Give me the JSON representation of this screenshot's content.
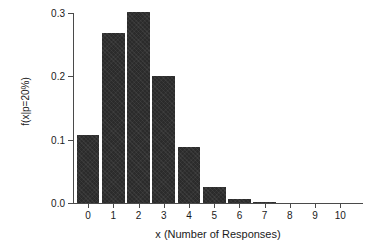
{
  "chart_data": {
    "type": "bar",
    "title": "",
    "xlabel": "x (Number of Responses)",
    "ylabel": "f(x|p=20%)",
    "categories": [
      "0",
      "1",
      "2",
      "3",
      "4",
      "5",
      "6",
      "7",
      "8",
      "9",
      "10"
    ],
    "values": [
      0.107,
      0.268,
      0.302,
      0.201,
      0.088,
      0.026,
      0.006,
      0.001,
      0.0,
      0.0,
      0.0
    ],
    "xlim": [
      -0.6,
      10.9
    ],
    "ylim": [
      0.0,
      0.3
    ],
    "ytick_labels": [
      "0.0",
      "0.1",
      "0.2",
      "0.3"
    ],
    "ytick_values": [
      0.0,
      0.1,
      0.2,
      0.3
    ],
    "xtick_labels": [
      "0",
      "1",
      "2",
      "3",
      "4",
      "5",
      "6",
      "7",
      "8",
      "9",
      "10"
    ],
    "xtick_values": [
      0,
      1,
      2,
      3,
      4,
      5,
      6,
      7,
      8,
      9,
      10
    ],
    "grid": false,
    "legend": null,
    "bar_color": "#2b2b2b",
    "axis_color": "#4a4a4a",
    "background_color": "#ffffff"
  }
}
